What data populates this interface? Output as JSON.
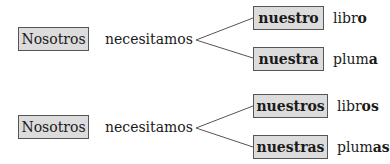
{
  "rows": [
    {
      "subject": "Nosotros",
      "verb": "necesitamos",
      "branches": [
        {
          "adjective": "nuestro",
          "noun_stem": "libr",
          "noun_ending": "o"
        },
        {
          "adjective": "nuestra",
          "noun_stem": "plum",
          "noun_ending": "a"
        }
      ]
    },
    {
      "subject": "Nosotros",
      "verb": "necesitamos",
      "branches": [
        {
          "adjective": "nuestros",
          "noun_stem": "libr",
          "noun_ending": "os"
        },
        {
          "adjective": "nuestras",
          "noun_stem": "plum",
          "noun_ending": "as"
        }
      ]
    }
  ],
  "colors": {
    "box_fill": "#dcdcdc",
    "box_border": "#555555",
    "line": "#555555"
  }
}
